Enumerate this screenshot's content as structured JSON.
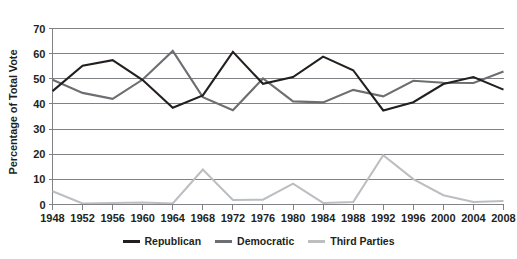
{
  "chart_data": {
    "type": "line",
    "title": "",
    "xlabel": "",
    "ylabel": "Percentage of Total Vote",
    "categories": [
      "1948",
      "1952",
      "1956",
      "1960",
      "1964",
      "1968",
      "1972",
      "1976",
      "1980",
      "1984",
      "1988",
      "1992",
      "1996",
      "2000",
      "2004",
      "2008"
    ],
    "xlim": [
      1948,
      2008
    ],
    "ylim": [
      0,
      70
    ],
    "yticks": [
      0,
      10,
      20,
      30,
      40,
      50,
      60,
      70
    ],
    "ytick_labels": [
      "0",
      "10",
      "20",
      "30",
      "40",
      "50",
      "60",
      "70"
    ],
    "grid": "horizontal",
    "legend_position": "bottom-center",
    "series": [
      {
        "name": "Republican",
        "color": "#231f20",
        "values": [
          45.1,
          55.2,
          57.4,
          49.5,
          38.5,
          43.4,
          60.7,
          48.0,
          50.7,
          58.8,
          53.4,
          37.4,
          40.7,
          47.9,
          50.7,
          45.7
        ]
      },
      {
        "name": "Democratic",
        "color": "#6d6e71",
        "values": [
          49.6,
          44.4,
          42.0,
          49.7,
          61.1,
          42.7,
          37.5,
          50.1,
          41.0,
          40.6,
          45.6,
          43.0,
          49.2,
          48.4,
          48.3,
          52.9
        ]
      },
      {
        "name": "Third Parties",
        "color": "#bcbec0",
        "values": [
          5.3,
          0.4,
          0.6,
          0.8,
          0.4,
          13.9,
          1.8,
          1.9,
          8.3,
          0.6,
          1.0,
          19.6,
          10.1,
          3.7,
          1.0,
          1.4
        ]
      }
    ]
  },
  "legend": {
    "items": [
      {
        "label": "Republican",
        "color": "#231f20"
      },
      {
        "label": "Democratic",
        "color": "#6d6e71"
      },
      {
        "label": "Third Parties",
        "color": "#bcbec0"
      }
    ]
  },
  "axes": {
    "y_title": "Percentage of Total Vote"
  }
}
